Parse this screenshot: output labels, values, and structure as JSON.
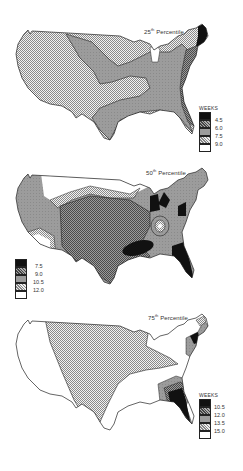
{
  "figure": {
    "unit_label": "WEEKS",
    "panels": [
      {
        "id": "p25",
        "title_prefix": "25",
        "title_sup": "th",
        "title_suffix": " Percentile",
        "legend_header": "WEEKS",
        "legend_values": [
          "4.5",
          "6.0",
          "7.5",
          "9.0"
        ],
        "legend_classes": [
          "black",
          "dense-dots",
          "gray",
          "checker",
          "white"
        ],
        "regions": [
          {
            "name": "West & Great Plains",
            "class": "checker",
            "range": "7.5–9.0"
          },
          {
            "name": "Central corridor & South",
            "class": "gray",
            "range": "6.0–7.5"
          },
          {
            "name": "Atlantic coastal band",
            "class": "dense-dots",
            "range": "4.5–6.0"
          },
          {
            "name": "New England",
            "class": "black",
            "range": "<4.5"
          },
          {
            "name": "Michigan",
            "class": "white",
            "range": ">9.0"
          }
        ]
      },
      {
        "id": "p50",
        "title_prefix": "50",
        "title_sup": "th",
        "title_suffix": " Percentile",
        "legend_header": "",
        "legend_values": [
          "7.5",
          "9.0",
          "10.5",
          "12.0"
        ],
        "legend_classes": [
          "black",
          "dense-dots",
          "gray",
          "checker",
          "white"
        ],
        "regions": [
          {
            "name": "Central US",
            "class": "dense-dots",
            "range": "7.5–9.0"
          },
          {
            "name": "Outer band",
            "class": "gray",
            "range": "9.0–10.5"
          },
          {
            "name": "Northern & SW bands",
            "class": "checker",
            "range": "10.5–12.0"
          },
          {
            "name": "Northern tier & SW",
            "class": "white",
            "range": ">12.0"
          },
          {
            "name": "Great Lakes, Mid-South, Southeast, Florida",
            "class": "black",
            "range": "<7.5"
          }
        ]
      },
      {
        "id": "p75",
        "title_prefix": "75",
        "title_sup": "th",
        "title_suffix": " Percentile",
        "legend_header": "WEEKS",
        "legend_values": [
          "10.5",
          "12.0",
          "13.5",
          "15.0"
        ],
        "legend_classes": [
          "black",
          "dense-dots",
          "gray",
          "checker",
          "white"
        ],
        "regions": [
          {
            "name": "Great Plains & Midwest",
            "class": "checker",
            "range": "13.5–15.0"
          },
          {
            "name": "West & South",
            "class": "white",
            "range": ">15.0"
          },
          {
            "name": "Southeast & Florida",
            "class": "black",
            "range": "<10.5"
          },
          {
            "name": "New England",
            "class": "black",
            "range": "<10.5"
          }
        ]
      }
    ]
  }
}
